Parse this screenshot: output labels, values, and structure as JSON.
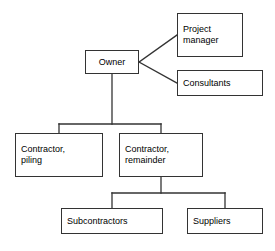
{
  "diagram": {
    "type": "org-chart",
    "canvas": {
      "width": 275,
      "height": 251
    },
    "style": {
      "box_fill": "#ffffff",
      "box_border": "#333333",
      "line_color": "#333333",
      "text_color": "#000000",
      "background": "#ffffff"
    },
    "nodes": [
      {
        "id": "owner",
        "label": "Owner",
        "level": 0,
        "x": 85,
        "y": 50,
        "w": 54,
        "h": 24,
        "align": "center"
      },
      {
        "id": "project-manager",
        "label": "Project\nmanager",
        "level": 1,
        "x": 177,
        "y": 13,
        "w": 66,
        "h": 44,
        "align": "left"
      },
      {
        "id": "consultants",
        "label": "Consultants",
        "level": 1,
        "x": 177,
        "y": 70,
        "w": 86,
        "h": 26,
        "align": "left"
      },
      {
        "id": "contractor-piling",
        "label": "Contractor,\npiling",
        "level": 1,
        "x": 15,
        "y": 133,
        "w": 88,
        "h": 44,
        "align": "left"
      },
      {
        "id": "contractor-remainder",
        "label": "Contractor,\nremainder",
        "level": 1,
        "x": 119,
        "y": 133,
        "w": 84,
        "h": 44,
        "align": "left"
      },
      {
        "id": "subcontractors",
        "label": "Subcontractors",
        "level": 2,
        "x": 61,
        "y": 208,
        "w": 102,
        "h": 26,
        "align": "left"
      },
      {
        "id": "suppliers",
        "label": "Suppliers",
        "level": 2,
        "x": 187,
        "y": 208,
        "w": 76,
        "h": 26,
        "align": "left"
      }
    ],
    "edges": [
      {
        "from": "owner",
        "to": "project-manager",
        "style": "diagonal"
      },
      {
        "from": "owner",
        "to": "consultants",
        "style": "diagonal"
      },
      {
        "from": "owner",
        "to": "contractor-piling",
        "style": "orthogonal"
      },
      {
        "from": "owner",
        "to": "contractor-remainder",
        "style": "orthogonal"
      },
      {
        "from": "contractor-remainder",
        "to": "subcontractors",
        "style": "orthogonal"
      },
      {
        "from": "contractor-remainder",
        "to": "suppliers",
        "style": "orthogonal"
      }
    ]
  }
}
